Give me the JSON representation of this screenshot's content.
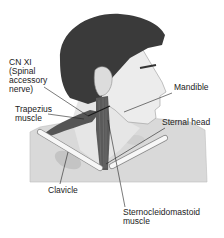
{
  "diagram": {
    "labels": {
      "cn_xi": "CN XI\n(Spinal\naccessory\nnerve)",
      "trapezius": "Trapezius\nmuscle",
      "mandible": "Mandible",
      "sternal_head": "Sternal head",
      "clavicle": "Clavicle",
      "sternocleidomastoid": "Sternocleidomastoid\nmuscle"
    },
    "colors": {
      "hair": "#3a3a3a",
      "skin": "#e6e6e6",
      "torso": "#d9d9d9",
      "muscle": "#5a5a5a",
      "bone": "#f7f7f7",
      "leader_line": "#222222",
      "text": "#222222"
    }
  }
}
